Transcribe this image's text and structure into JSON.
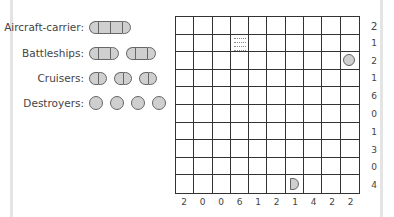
{
  "fleet": [
    {
      "label": "Aircraft-carrier:",
      "ships": 1,
      "length": 4
    },
    {
      "label": "Battleships:",
      "ships": 2,
      "length": 3
    },
    {
      "label": "Cruisers:",
      "ships": 3,
      "length": 2
    },
    {
      "label": "Destroyers:",
      "ships": 4,
      "length": 1
    }
  ],
  "grid": {
    "rows": 10,
    "cols": 10,
    "given": [
      {
        "row": 1,
        "col": 3,
        "type": "water",
        "icon": "water-icon"
      },
      {
        "row": 2,
        "col": 9,
        "type": "submarine",
        "icon": "circle-ship-icon"
      },
      {
        "row": 9,
        "col": 6,
        "type": "ship-end-right",
        "icon": "ship-end-right-icon"
      }
    ]
  },
  "row_clues": [
    "2",
    "1",
    "2",
    "1",
    "6",
    "0",
    "1",
    "3",
    "0",
    "4"
  ],
  "col_clues": [
    "2",
    "0",
    "0",
    "6",
    "1",
    "2",
    "1",
    "4",
    "2",
    "2"
  ]
}
